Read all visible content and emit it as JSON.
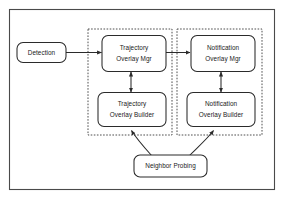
{
  "figure": {
    "background_color": "#ffffff",
    "frame_color": "#4a4a4a",
    "node_stroke_color": "#2b2b2b",
    "node_fill_color": "#ffffff",
    "group_stroke_color": "#3a3a3a",
    "edge_color": "#2b2b2b"
  },
  "nodes": {
    "detection": {
      "line1": "Detection",
      "line2": ""
    },
    "trajectory_overlay_mgr": {
      "line1": "Trajectory",
      "line2": "Overlay Mgr"
    },
    "notification_overlay_mgr": {
      "line1": "Notification",
      "line2": "Overlay Mgr"
    },
    "trajectory_overlay_builder": {
      "line1": "Trajectory",
      "line2": "Overlay Builder"
    },
    "notification_overlay_builder": {
      "line1": "Notification",
      "line2": "Overlay Builder"
    },
    "neighbor_probing": {
      "line1": "Neighbor Probing",
      "line2": ""
    }
  },
  "groups": {
    "trajectory_group": {
      "label": ""
    },
    "notification_group": {
      "label": ""
    }
  },
  "edges": [
    {
      "from": "detection",
      "to": "trajectory_overlay_mgr",
      "style": "solid",
      "arrow": "single"
    },
    {
      "from": "trajectory_overlay_mgr",
      "to": "notification_overlay_mgr",
      "style": "solid",
      "arrow": "single"
    },
    {
      "from": "trajectory_overlay_mgr",
      "to": "trajectory_overlay_builder",
      "style": "solid",
      "arrow": "double"
    },
    {
      "from": "notification_overlay_mgr",
      "to": "notification_overlay_builder",
      "style": "solid",
      "arrow": "double"
    },
    {
      "from": "neighbor_probing",
      "to": "trajectory_overlay_builder",
      "style": "curved",
      "arrow": "single"
    },
    {
      "from": "neighbor_probing",
      "to": "notification_overlay_builder",
      "style": "curved",
      "arrow": "single"
    }
  ]
}
